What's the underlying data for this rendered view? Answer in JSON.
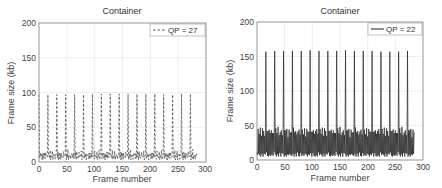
{
  "chart_data": [
    {
      "type": "line",
      "title": "Container",
      "xlabel": "Frame number",
      "ylabel": "Frame size (kb)",
      "xlim": [
        0,
        300
      ],
      "ylim": [
        0,
        200
      ],
      "xticks": [
        0,
        50,
        100,
        150,
        200,
        250,
        300
      ],
      "yticks": [
        0,
        50,
        100,
        150,
        200
      ],
      "grid": true,
      "legend_position": "upper right",
      "series": [
        {
          "name": "QP = 27",
          "line_style": "dashed",
          "color": "#555555",
          "gop_length": 16,
          "frame_count": 285,
          "i_frame_positions": [
            0,
            16,
            32,
            48,
            64,
            80,
            96,
            112,
            128,
            144,
            160,
            176,
            192,
            208,
            224,
            240,
            256,
            272
          ],
          "i_frame_sizes": [
            97,
            97,
            97,
            97,
            97,
            97,
            98,
            98,
            98,
            98,
            98,
            98,
            98,
            98,
            97,
            97,
            98,
            98
          ],
          "gop_pattern_sizes": [
            97,
            6,
            12,
            5,
            15,
            4,
            10,
            6,
            13,
            5,
            11,
            7,
            14,
            5,
            10,
            8
          ],
          "range_non_i_frames": [
            3,
            28
          ]
        }
      ]
    },
    {
      "type": "line",
      "title": "Container",
      "xlabel": "Frame number",
      "ylabel": "Frame size (kb)",
      "xlim": [
        0,
        300
      ],
      "ylim": [
        0,
        200
      ],
      "xticks": [
        0,
        50,
        100,
        150,
        200,
        250,
        300
      ],
      "yticks": [
        0,
        50,
        100,
        150,
        200
      ],
      "grid": true,
      "legend_position": "upper right",
      "series": [
        {
          "name": "QP = 22",
          "line_style": "solid",
          "color": "#222222",
          "gop_length": 16,
          "frame_count": 285,
          "i_frame_positions": [
            16,
            32,
            48,
            64,
            80,
            96,
            112,
            128,
            144,
            160,
            176,
            192,
            208,
            224,
            240,
            256,
            272
          ],
          "i_frame_sizes": [
            157,
            158,
            158,
            158,
            158,
            159,
            158,
            158,
            158,
            159,
            158,
            158,
            158,
            157,
            157,
            157,
            158
          ],
          "gop_pattern_sizes": [
            157,
            8,
            44,
            6,
            40,
            7,
            45,
            6,
            36,
            8,
            43,
            6,
            42,
            7,
            38,
            9
          ],
          "range_non_i_frames": [
            5,
            62
          ]
        }
      ]
    }
  ],
  "left": {
    "title": "Container",
    "xlabel": "Frame number",
    "ylabel": "Frame size (kb)",
    "legend": "QP = 27",
    "xticks": [
      "0",
      "50",
      "100",
      "150",
      "200",
      "250",
      "300"
    ],
    "yticks": [
      "0",
      "50",
      "100",
      "150",
      "200"
    ]
  },
  "right": {
    "title": "Container",
    "xlabel": "Frame number",
    "ylabel": "Frame size (kb)",
    "legend": "QP = 22",
    "xticks": [
      "0",
      "50",
      "100",
      "150",
      "200",
      "250",
      "300"
    ],
    "yticks": [
      "0",
      "50",
      "100",
      "150",
      "200"
    ]
  }
}
